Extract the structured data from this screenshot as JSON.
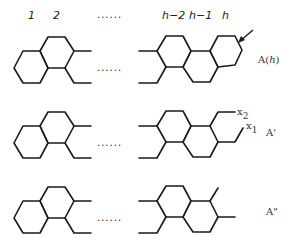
{
  "header": {
    "ring_labels": [
      "1",
      "2",
      "......",
      "h−2",
      "h−1",
      "h"
    ]
  },
  "structures": [
    {
      "id": "A(h)",
      "label": "A(h)",
      "label_prefix": "A(",
      "label_var": "h",
      "label_suffix": ")",
      "ellipsis": "......",
      "marker": "arrow pointing to terminal ring vertex"
    },
    {
      "id": "A'",
      "label": "A'",
      "ellipsis": "......",
      "substituents": [
        "x2",
        "x1"
      ]
    },
    {
      "id": "A\"",
      "label": "A\"",
      "ellipsis": "......"
    }
  ],
  "substituent_labels": {
    "x2_base": "x",
    "x2_sub": "2",
    "x1_base": "x",
    "x1_sub": "1"
  },
  "colors": {
    "ink": "#1a1a1a",
    "background": "#ffffff"
  }
}
